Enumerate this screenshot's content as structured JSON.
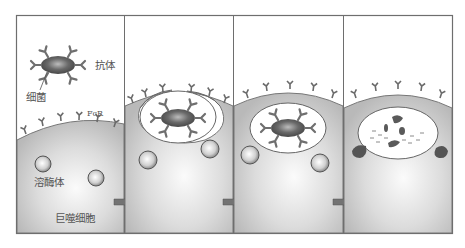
{
  "figure": {
    "labels": {
      "antibody": "抗体",
      "bacterium": "细菌",
      "fc_receptor": "FcR",
      "lysosome": "溶酶体",
      "macrophage": "巨噬细胞"
    },
    "panels": [
      {
        "step": 1,
        "description": "antibody-coated bacterium approaches macrophage with FcR"
      },
      {
        "step": 2,
        "description": "membrane engulfs opsonized bacterium"
      },
      {
        "step": 3,
        "description": "phagosome containing bacterium"
      },
      {
        "step": 4,
        "description": "lysosomes fuse, bacterium degraded"
      }
    ],
    "colors": {
      "frame": "#6e6e6e",
      "cell_fill": "#c9c9c9",
      "cell_highlight": "#f4f4f4",
      "bacterium": "#5a5a5a",
      "antibody": "#7a7a7a",
      "arrow": "#707070"
    }
  }
}
